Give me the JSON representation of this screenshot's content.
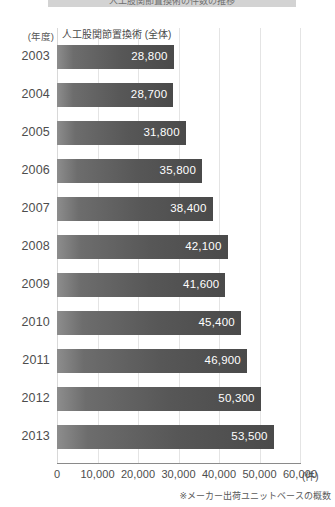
{
  "title": {
    "text": "人工股関節置換術の件数の推移"
  },
  "year_axis": {
    "header": "(年度)"
  },
  "series_caption": "人工股関節置換術 (全体)",
  "x_axis": {
    "unit": "(件)",
    "ticks": [
      "0",
      "10,000",
      "20,000",
      "30,000",
      "40,000",
      "50,000",
      "60,000"
    ]
  },
  "footnote": "※メーカー出荷ユニットベースの概数",
  "colors": {
    "bar_dark": "#4a4a4a",
    "bar_light": "#8d8d8d",
    "gridline": "#e4e4e4",
    "axis": "#8a8a8a",
    "value_text": "#ffffff"
  },
  "chart_data": {
    "type": "bar",
    "orientation": "horizontal",
    "title": "人工股関節置換術の件数の推移",
    "xlabel": "(件)",
    "ylabel": "(年度)",
    "xlim": [
      0,
      60000
    ],
    "xticks": [
      0,
      10000,
      20000,
      30000,
      40000,
      50000,
      60000
    ],
    "grid": true,
    "legend": false,
    "series_name": "人工股関節置換術 (全体)",
    "categories": [
      "2003",
      "2004",
      "2005",
      "2006",
      "2007",
      "2008",
      "2009",
      "2010",
      "2011",
      "2012",
      "2013"
    ],
    "values": [
      28800,
      28700,
      31800,
      35800,
      38400,
      42100,
      41600,
      45400,
      46900,
      50300,
      53500
    ],
    "value_labels": [
      "28,800",
      "28,700",
      "31,800",
      "35,800",
      "38,400",
      "42,100",
      "41,600",
      "45,400",
      "46,900",
      "50,300",
      "53,500"
    ],
    "annotation": "※メーカー出荷ユニットベースの概数"
  }
}
